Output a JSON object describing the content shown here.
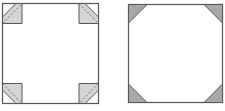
{
  "diagram": {
    "colors": {
      "outline": "#555555",
      "fill_gray": "#d4d4d4",
      "fill_dark": "#a8a8a8",
      "background": "#ffffff"
    },
    "left_figure": {
      "label": "",
      "corner_squares": 4,
      "fold_line": "dashed diagonal"
    },
    "right_figure": {
      "label": "",
      "corner_triangles": 4
    }
  }
}
